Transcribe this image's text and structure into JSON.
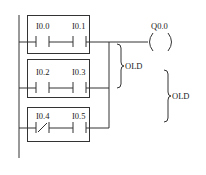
{
  "diagram": {
    "type": "PLC ladder diagram",
    "rungs": [
      {
        "contacts": [
          {
            "label": "I0.0",
            "type": "NO"
          },
          {
            "label": "I0.1",
            "type": "NO"
          }
        ]
      },
      {
        "contacts": [
          {
            "label": "I0.2",
            "type": "NO"
          },
          {
            "label": "I0.3",
            "type": "NO"
          }
        ]
      },
      {
        "contacts": [
          {
            "label": "I0.4",
            "type": "NC"
          },
          {
            "label": "I0.5",
            "type": "NO"
          }
        ]
      }
    ],
    "coil": {
      "label": "Q0.0"
    },
    "brackets": [
      {
        "label": "OLD",
        "spans": "rung 1 and rung 2"
      },
      {
        "label": "OLD",
        "spans": "result and rung 3"
      }
    ]
  },
  "labels": {
    "c1": "I0.0",
    "c2": "I0.1",
    "c3": "I0.2",
    "c4": "I0.3",
    "c5": "I0.4",
    "c6": "I0.5",
    "coil": "Q0.0",
    "old1": "OLD",
    "old2": "OLD"
  }
}
